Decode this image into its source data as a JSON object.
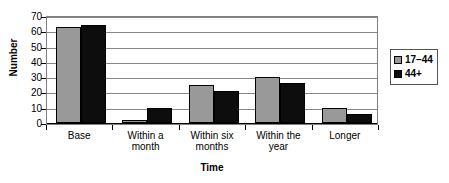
{
  "chart_data": {
    "type": "bar",
    "title": "",
    "xlabel": "Time",
    "ylabel": "Number",
    "categories": [
      "Base",
      "Within a\nmonth",
      "Within six\nmonths",
      "Within the\nyear",
      "Longer"
    ],
    "ylim": [
      0,
      70
    ],
    "yticks": [
      70,
      60,
      50,
      40,
      30,
      20,
      10,
      0
    ],
    "ytick_labels": [
      "70",
      "60",
      "50",
      "40",
      "30",
      "20",
      "10",
      "0"
    ],
    "grid": true,
    "legend_position": "right",
    "series": [
      {
        "name": "17–44",
        "color": "#999999",
        "values": [
          63,
          2,
          25,
          30,
          10
        ]
      },
      {
        "name": "44+",
        "color": "#0d0d0d",
        "values": [
          64,
          10,
          21,
          26,
          6
        ]
      }
    ]
  },
  "legend": {
    "entries": [
      {
        "label": "17–44",
        "swatch": "legend-swatch-gray"
      },
      {
        "label": "44+",
        "swatch": "legend-swatch-black"
      }
    ]
  }
}
